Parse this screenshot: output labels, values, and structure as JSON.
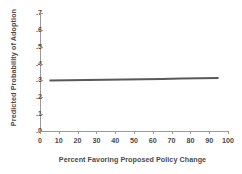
{
  "chart_data": {
    "type": "line",
    "title": "",
    "xlabel": "Percent Favoring Proposed Policy Change",
    "ylabel": "Predicted Probability of Adoption",
    "xlim": [
      0,
      100
    ],
    "ylim": [
      0.0,
      0.7
    ],
    "grid": false,
    "legend": "none",
    "xticks": [
      0,
      10,
      20,
      30,
      40,
      50,
      60,
      70,
      80,
      90,
      100
    ],
    "xtick_labels": [
      "0",
      "10",
      "20",
      "30",
      "40",
      "50",
      "60",
      "70",
      "80",
      "90",
      "100"
    ],
    "yticks": [
      0.0,
      0.1,
      0.2,
      0.3,
      0.4,
      0.5,
      0.6,
      0.7
    ],
    "ytick_labels": [
      ".0",
      ".1",
      ".2",
      ".3",
      ".4",
      ".5",
      ".6",
      ".7"
    ],
    "series": [
      {
        "name": "Predicted probability",
        "color": "#595959",
        "linewidth": 2,
        "x": [
          5,
          15,
          25,
          35,
          45,
          55,
          65,
          75,
          85,
          95
        ],
        "values": [
          0.3,
          0.301,
          0.302,
          0.304,
          0.305,
          0.307,
          0.309,
          0.311,
          0.313,
          0.315
        ]
      }
    ]
  },
  "figure": {
    "background": "#ffffff",
    "axis_color": "#9a9a9a",
    "text_color": "#4a4a4a"
  }
}
